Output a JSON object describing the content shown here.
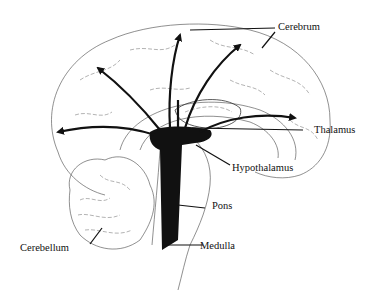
{
  "diagram": {
    "labels": {
      "cerebrum": "Cerebrum",
      "thalamus": "Thalamus",
      "hypothalamus": "Hypothalamus",
      "pons": "Pons",
      "medulla": "Medulla",
      "cerebellum": "Cerebellum"
    },
    "colors": {
      "ink": "#111111",
      "background": "#ffffff",
      "outline": "#444444"
    },
    "arrow_count": 6
  }
}
